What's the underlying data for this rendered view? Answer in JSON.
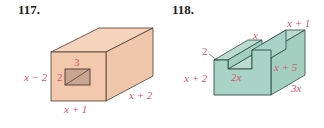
{
  "figures": [
    {
      "number": "117.",
      "shape": "rectangular box with rectangular hole",
      "colors": {
        "face": "#f3c9ad",
        "face_top": "#f6d3bb",
        "face_side": "#f1c7ab",
        "hole": "#c9a592",
        "edge": "#4a3a30",
        "label": "#d4566f"
      },
      "labels": {
        "hole_width": "3",
        "hole_height": "2",
        "box_height": "x − 2",
        "box_width": "x + 1",
        "box_depth": "x + 2"
      }
    },
    {
      "number": "118.",
      "shape": "stepped block (L-shaped prism with notch)",
      "colors": {
        "face": "#a9d3c6",
        "face_top": "#b9dccf",
        "face_side": "#a3cfc1",
        "edge": "#2f4a42",
        "label": "#d4566f"
      },
      "labels": {
        "notch_depth": "2",
        "notch_top": "x",
        "left_height": "x + 2",
        "notch_width": "2x",
        "right_height": "x + 5",
        "top_right": "x + 1",
        "depth": "3x"
      }
    }
  ]
}
